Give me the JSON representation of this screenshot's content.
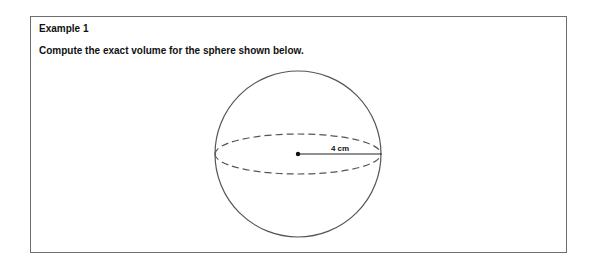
{
  "example": {
    "title": "Example 1",
    "prompt": "Compute the exact volume for the sphere shown below."
  },
  "figure": {
    "shape": "sphere",
    "radius_label": "4 cm",
    "stroke_color": "#555555"
  }
}
